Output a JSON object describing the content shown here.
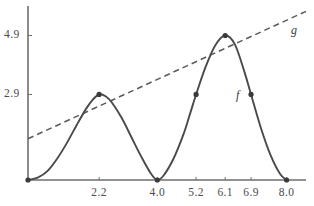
{
  "figure": {
    "background_color": "#ffffff",
    "axis_color": "#6e6e6e",
    "curve_color": "#4a4a4a",
    "line_color": "#5a5a5a",
    "point_color": "#3a3a3a",
    "text_color": "#4a4a4a"
  },
  "labels": {
    "f": "f",
    "g": "g"
  },
  "chart_data": {
    "type": "line",
    "title": "",
    "xlabel": "",
    "ylabel": "",
    "xlim": [
      0,
      8.6
    ],
    "ylim": [
      0,
      5.9
    ],
    "grid": false,
    "legend": "inline-curve-labels",
    "x_ticks": [
      {
        "value": 2.2,
        "label": "2.2"
      },
      {
        "value": 4.0,
        "label": "4.0"
      },
      {
        "value": 5.2,
        "label": "5.2"
      },
      {
        "value": 6.1,
        "label": "6.1"
      },
      {
        "value": 6.9,
        "label": "6.9"
      },
      {
        "value": 8.0,
        "label": "8.0"
      }
    ],
    "y_ticks": [
      {
        "value": 2.9,
        "label": "2.9"
      },
      {
        "value": 4.9,
        "label": "4.9"
      }
    ],
    "series": [
      {
        "name": "f",
        "style": "solid",
        "description": "oscillating curve with two humps touching g at its maxima",
        "points": [
          {
            "x": 0.0,
            "y": 0.0
          },
          {
            "x": 0.3,
            "y": 0.08
          },
          {
            "x": 0.6,
            "y": 0.3
          },
          {
            "x": 0.9,
            "y": 0.72
          },
          {
            "x": 1.2,
            "y": 1.25
          },
          {
            "x": 1.5,
            "y": 1.85
          },
          {
            "x": 1.8,
            "y": 2.42
          },
          {
            "x": 2.0,
            "y": 2.72
          },
          {
            "x": 2.2,
            "y": 2.9
          },
          {
            "x": 2.4,
            "y": 2.84
          },
          {
            "x": 2.6,
            "y": 2.62
          },
          {
            "x": 2.9,
            "y": 2.1
          },
          {
            "x": 3.2,
            "y": 1.45
          },
          {
            "x": 3.5,
            "y": 0.8
          },
          {
            "x": 3.8,
            "y": 0.22
          },
          {
            "x": 4.0,
            "y": 0.0
          },
          {
            "x": 4.2,
            "y": 0.16
          },
          {
            "x": 4.5,
            "y": 0.72
          },
          {
            "x": 4.8,
            "y": 1.52
          },
          {
            "x": 5.0,
            "y": 2.2
          },
          {
            "x": 5.2,
            "y": 2.9
          },
          {
            "x": 5.5,
            "y": 3.85
          },
          {
            "x": 5.8,
            "y": 4.58
          },
          {
            "x": 6.1,
            "y": 4.9
          },
          {
            "x": 6.4,
            "y": 4.6
          },
          {
            "x": 6.7,
            "y": 3.65
          },
          {
            "x": 6.9,
            "y": 2.9
          },
          {
            "x": 7.2,
            "y": 1.78
          },
          {
            "x": 7.5,
            "y": 0.85
          },
          {
            "x": 7.8,
            "y": 0.2
          },
          {
            "x": 8.0,
            "y": 0.0
          }
        ],
        "marked_points": [
          {
            "x": 0.0,
            "y": 0.0
          },
          {
            "x": 2.2,
            "y": 2.9
          },
          {
            "x": 4.0,
            "y": 0.0
          },
          {
            "x": 5.2,
            "y": 2.9
          },
          {
            "x": 6.1,
            "y": 4.9
          },
          {
            "x": 6.9,
            "y": 2.9
          },
          {
            "x": 8.0,
            "y": 0.0
          }
        ],
        "label": "f"
      },
      {
        "name": "g",
        "style": "dashed",
        "description": "straight dashed envelope line through the maxima of f",
        "points": [
          {
            "x": 0.0,
            "y": 1.4
          },
          {
            "x": 8.6,
            "y": 5.72
          }
        ],
        "label": "g"
      }
    ],
    "annotations": [
      {
        "text": "f",
        "x": 7.2,
        "y": 2.95,
        "style": "italic"
      },
      {
        "text": "g",
        "x": 8.3,
        "y": 5.28,
        "style": "italic"
      }
    ]
  }
}
